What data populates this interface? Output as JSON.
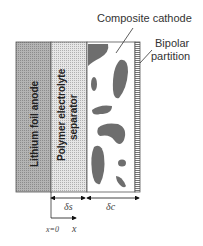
{
  "labels": {
    "composite_cathode": "Composite cathode",
    "bipolar_1": "Bipolar",
    "bipolar_2": "partition",
    "anode": "Lithium foil anode",
    "separator_1": "Polymer electrolyte",
    "separator_2": "separator",
    "delta_s": "δs",
    "delta_c": "δc",
    "x0": "x=0",
    "x": "x"
  },
  "colors": {
    "anode": "#a8a8a8",
    "separator": "#d8d8d8",
    "particles": "#6e6e6e",
    "partition": "#9a9a9a"
  }
}
